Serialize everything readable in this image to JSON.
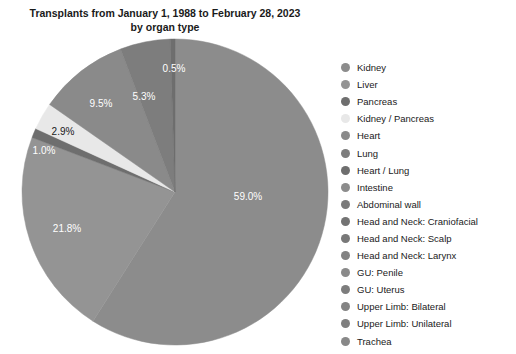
{
  "chart_data": {
    "type": "pie",
    "title": "Transplants from January 1, 1988 to February 28, 2023\nby organ type",
    "categories": [
      "Kidney",
      "Liver",
      "Pancreas",
      "Kidney / Pancreas",
      "Heart",
      "Lung",
      "Heart / Lung",
      "Intestine",
      "Abdominal wall",
      "Head and Neck: Craniofacial",
      "Head and Neck: Scalp",
      "Head and Neck: Larynx",
      "GU: Penile",
      "GU: Uterus",
      "Upper Limb: Bilateral",
      "Upper Limb: Unilateral",
      "Trachea"
    ],
    "values": [
      59.0,
      21.8,
      1.0,
      2.9,
      9.5,
      5.3,
      0.5,
      0.0,
      0.0,
      0.0,
      0.0,
      0.0,
      0.0,
      0.0,
      0.0,
      0.0,
      0.0
    ],
    "labels_shown": [
      "59.0%",
      "21.8%",
      "1.0%",
      "2.9%",
      "9.5%",
      "5.3%",
      "0.5%"
    ],
    "colors": [
      "#8c8c8c",
      "#949494",
      "#6e6e6e",
      "#e8e8e8",
      "#8a8a8a",
      "#7d7d7d",
      "#6e6e6e",
      "#8c8c8c",
      "#7a7a7a",
      "#737373",
      "#787878",
      "#828282",
      "#8a8a8a",
      "#7d7d7d",
      "#848484",
      "#7f7f7f",
      "#888888"
    ],
    "legend_position": "right",
    "grid": false,
    "xlabel": "",
    "ylabel": ""
  },
  "chart": {
    "title": "Transplants from January 1, 1988 to February 28, 2023\nby organ type",
    "slices": [
      {
        "name": "Kidney",
        "percent": "59.0%",
        "value": 59.0,
        "color": "#8c8c8c",
        "label_color": "#ffffff",
        "label_x": 248,
        "label_y": 196,
        "show_label": true
      },
      {
        "name": "Liver",
        "percent": "21.8%",
        "value": 21.8,
        "color": "#949494",
        "label_color": "#ffffff",
        "label_x": 67,
        "label_y": 228,
        "show_label": true
      },
      {
        "name": "Pancreas",
        "percent": "1.0%",
        "value": 1.0,
        "color": "#6e6e6e",
        "label_color": "#ffffff",
        "label_x": 44,
        "label_y": 150,
        "show_label": true
      },
      {
        "name": "Kidney / Pancreas",
        "percent": "2.9%",
        "value": 2.9,
        "color": "#e8e8e8",
        "label_color": "#1a1a1a",
        "label_x": 63,
        "label_y": 131,
        "show_label": true
      },
      {
        "name": "Heart",
        "percent": "9.5%",
        "value": 9.5,
        "color": "#8a8a8a",
        "label_color": "#ffffff",
        "label_x": 101,
        "label_y": 103,
        "show_label": true
      },
      {
        "name": "Lung",
        "percent": "5.3%",
        "value": 5.3,
        "color": "#7d7d7d",
        "label_color": "#ffffff",
        "label_x": 144,
        "label_y": 96,
        "show_label": true
      },
      {
        "name": "Heart / Lung",
        "percent": "0.5%",
        "value": 0.5,
        "color": "#6e6e6e",
        "label_color": "#ffffff",
        "label_x": 174,
        "label_y": 68,
        "show_label": true
      },
      {
        "name": "Intestine",
        "percent": "0.0%",
        "value": 0.0,
        "color": "#8c8c8c",
        "label_color": "#ffffff",
        "label_x": 0,
        "label_y": 0,
        "show_label": false
      },
      {
        "name": "Abdominal wall",
        "percent": "0.0%",
        "value": 0.0,
        "color": "#7a7a7a",
        "label_color": "#ffffff",
        "label_x": 0,
        "label_y": 0,
        "show_label": false
      },
      {
        "name": "Head and Neck: Craniofacial",
        "percent": "0.0%",
        "value": 0.0,
        "color": "#737373",
        "label_color": "#ffffff",
        "label_x": 0,
        "label_y": 0,
        "show_label": false
      },
      {
        "name": "Head and Neck: Scalp",
        "percent": "0.0%",
        "value": 0.0,
        "color": "#787878",
        "label_color": "#ffffff",
        "label_x": 0,
        "label_y": 0,
        "show_label": false
      },
      {
        "name": "Head and Neck: Larynx",
        "percent": "0.0%",
        "value": 0.0,
        "color": "#828282",
        "label_color": "#ffffff",
        "label_x": 0,
        "label_y": 0,
        "show_label": false
      },
      {
        "name": "GU: Penile",
        "percent": "0.0%",
        "value": 0.0,
        "color": "#8a8a8a",
        "label_color": "#ffffff",
        "label_x": 0,
        "label_y": 0,
        "show_label": false
      },
      {
        "name": "GU: Uterus",
        "percent": "0.0%",
        "value": 0.0,
        "color": "#7d7d7d",
        "label_color": "#ffffff",
        "label_x": 0,
        "label_y": 0,
        "show_label": false
      },
      {
        "name": "Upper Limb: Bilateral",
        "percent": "0.0%",
        "value": 0.0,
        "color": "#848484",
        "label_color": "#ffffff",
        "label_x": 0,
        "label_y": 0,
        "show_label": false
      },
      {
        "name": "Upper Limb: Unilateral",
        "percent": "0.0%",
        "value": 0.0,
        "color": "#7f7f7f",
        "label_color": "#ffffff",
        "label_x": 0,
        "label_y": 0,
        "show_label": false
      },
      {
        "name": "Trachea",
        "percent": "0.0%",
        "value": 0.0,
        "color": "#888888",
        "label_color": "#ffffff",
        "label_x": 0,
        "label_y": 0,
        "show_label": false
      }
    ],
    "geometry": {
      "cx": 175,
      "cy": 192,
      "r": 153,
      "start_angle_deg": -90
    }
  },
  "legend": {
    "items": [
      {
        "label": "Kidney",
        "color": "#8c8c8c"
      },
      {
        "label": "Liver",
        "color": "#949494"
      },
      {
        "label": "Pancreas",
        "color": "#6e6e6e"
      },
      {
        "label": "Kidney / Pancreas",
        "color": "#e8e8e8"
      },
      {
        "label": "Heart",
        "color": "#8a8a8a"
      },
      {
        "label": "Lung",
        "color": "#7d7d7d"
      },
      {
        "label": "Heart / Lung",
        "color": "#6e6e6e"
      },
      {
        "label": "Intestine",
        "color": "#8c8c8c"
      },
      {
        "label": "Abdominal wall",
        "color": "#7a7a7a"
      },
      {
        "label": "Head and Neck: Craniofacial",
        "color": "#737373"
      },
      {
        "label": "Head and Neck: Scalp",
        "color": "#787878"
      },
      {
        "label": "Head and Neck: Larynx",
        "color": "#828282"
      },
      {
        "label": "GU: Penile",
        "color": "#8a8a8a"
      },
      {
        "label": "GU: Uterus",
        "color": "#7d7d7d"
      },
      {
        "label": "Upper Limb: Bilateral",
        "color": "#848484"
      },
      {
        "label": "Upper Limb: Unilateral",
        "color": "#7f7f7f"
      },
      {
        "label": "Trachea",
        "color": "#888888"
      }
    ]
  }
}
